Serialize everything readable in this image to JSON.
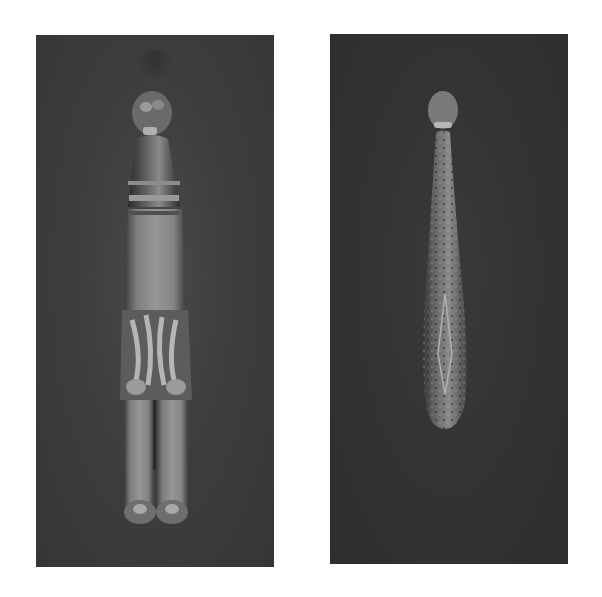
{
  "image": {
    "description": "Photograph of two ancient belt hooks shown side by side on dark backgrounds",
    "panels": [
      {
        "subject": "Jade and gilt-bronze belt hook with animal-head terminal, carved jade body and gilt openwork midsection"
      },
      {
        "subject": "Bronze belt hook with animal-head terminal, club-shaped body decorated with inlaid scroll patterns"
      }
    ],
    "colors": {
      "background": "#ffffff",
      "panel_left": "#424242",
      "panel_right": "#333333",
      "jade": "#8a8a8a",
      "bronze": "#6e6e6e"
    }
  }
}
